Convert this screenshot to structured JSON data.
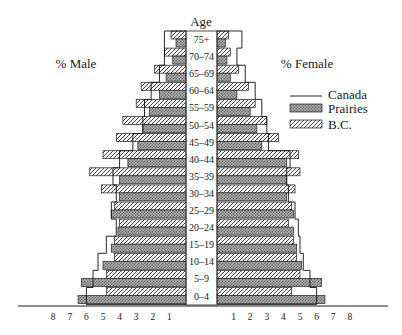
{
  "chart_data": {
    "type": "bar",
    "subtype": "population-pyramid",
    "title": "Age",
    "left_label": "% Male",
    "right_label": "% Female",
    "categories": [
      "75+",
      "70–74",
      "65–69",
      "60–64",
      "55–59",
      "50–54",
      "45–49",
      "40–44",
      "35–39",
      "30–34",
      "25–29",
      "20–24",
      "15–19",
      "10–14",
      "5–9",
      "0–4"
    ],
    "x_ticks_left": [
      "8",
      "7",
      "6",
      "5",
      "4",
      "3",
      "2",
      "1"
    ],
    "x_ticks_right": [
      "1",
      "2",
      "3",
      "4",
      "5",
      "6",
      "7",
      "8"
    ],
    "xlim": [
      0,
      8
    ],
    "legend": [
      {
        "name": "Canada",
        "style": "outline"
      },
      {
        "name": "Prairies",
        "style": "crosshatch"
      },
      {
        "name": "B.C.",
        "style": "diagonal-hatch"
      }
    ],
    "series": [
      {
        "name": "B.C.",
        "sex": "male",
        "values": [
          0.9,
          1.3,
          1.9,
          2.7,
          3.0,
          3.8,
          4.2,
          5.0,
          5.8,
          5.1,
          4.3,
          4.0,
          4.3,
          4.3,
          4.8,
          4.8
        ]
      },
      {
        "name": "Prairies",
        "sex": "male",
        "values": [
          0.6,
          0.8,
          1.2,
          1.6,
          2.2,
          2.6,
          2.9,
          3.5,
          4.0,
          4.0,
          4.5,
          4.1,
          4.5,
          5.0,
          6.3,
          6.5
        ]
      },
      {
        "name": "Canada",
        "sex": "male",
        "values": [
          1.3,
          1.3,
          1.6,
          2.1,
          2.5,
          2.6,
          3.2,
          4.0,
          4.4,
          4.2,
          4.5,
          4.2,
          4.8,
          5.3,
          5.6,
          6.0
        ]
      },
      {
        "name": "B.C.",
        "sex": "female",
        "values": [
          0.7,
          0.8,
          1.3,
          1.9,
          2.3,
          3.0,
          3.7,
          4.9,
          5.0,
          4.7,
          4.5,
          4.3,
          4.6,
          4.8,
          5.0,
          4.5
        ]
      },
      {
        "name": "Prairies",
        "sex": "female",
        "values": [
          0.5,
          0.6,
          0.8,
          1.2,
          2.0,
          2.4,
          2.7,
          4.2,
          4.2,
          4.2,
          4.6,
          4.6,
          4.8,
          5.1,
          6.3,
          6.5
        ]
      },
      {
        "name": "Canada",
        "sex": "female",
        "values": [
          1.5,
          1.2,
          1.7,
          2.3,
          2.7,
          3.0,
          3.1,
          4.4,
          4.2,
          4.3,
          4.7,
          4.9,
          5.0,
          5.2,
          5.6,
          6.0
        ]
      }
    ]
  }
}
